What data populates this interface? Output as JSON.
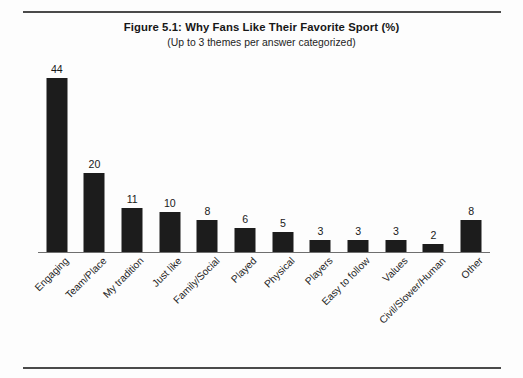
{
  "figure": {
    "title": "Figure 5.1: Why Fans Like Their Favorite Sport (%)",
    "subtitle": "(Up to 3 themes per answer categorized)"
  },
  "colors": {
    "bar": "#1c1c1c",
    "axis": "#6f6f6f",
    "rule": "#4a4a4a",
    "background": "#fdfdfd",
    "text": "#1a1a1a"
  },
  "chart_data": {
    "type": "bar",
    "title": "Figure 5.1: Why Fans Like Their Favorite Sport (%)",
    "subtitle": "(Up to 3 themes per answer categorized)",
    "xlabel": "",
    "ylabel": "",
    "ylim": [
      0,
      48
    ],
    "grid": false,
    "legend": false,
    "axis_visible": {
      "x": true,
      "y": false
    },
    "value_labels": true,
    "tick_label_rotation": -45,
    "categories": [
      "Engaging",
      "Team/Place",
      "My tradition",
      "Just like",
      "Family/Social",
      "Played",
      "Physical",
      "Players",
      "Easy to follow",
      "Values",
      "Civil/Slower/Human",
      "Other"
    ],
    "values": [
      44,
      20,
      11,
      10,
      8,
      6,
      5,
      3,
      3,
      3,
      2,
      8
    ],
    "value_label_texts": [
      "44",
      "20",
      "11",
      "10",
      "8",
      "6",
      "5",
      "3",
      "3",
      "3",
      "2",
      "8"
    ]
  }
}
